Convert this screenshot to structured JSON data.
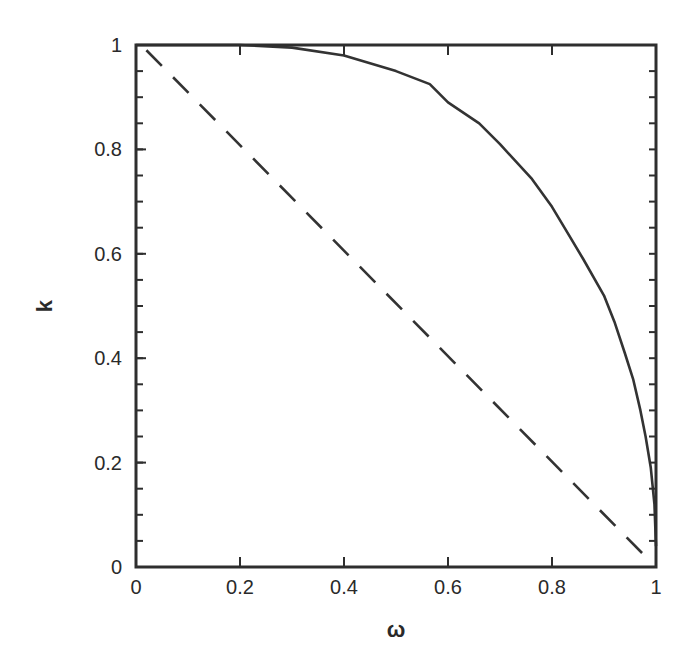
{
  "chart_data": {
    "type": "line",
    "title": "",
    "xlabel": "ω",
    "ylabel": "k",
    "xlim": [
      0,
      1
    ],
    "ylim": [
      0,
      1
    ],
    "grid": false,
    "legend": "none",
    "x_ticks": [
      0,
      0.2,
      0.4,
      0.6,
      0.8,
      1
    ],
    "x_tick_labels": [
      "0",
      "0.2",
      "0.4",
      "0.6",
      "0.8",
      "1"
    ],
    "y_ticks": [
      0,
      0.2,
      0.4,
      0.6,
      0.8,
      1
    ],
    "y_tick_labels": [
      "0",
      "0.2",
      "0.4",
      "0.6",
      "0.8",
      "1"
    ],
    "y_minor_step": 0.05,
    "series": [
      {
        "name": "solid-curve",
        "style": "solid",
        "color": "#333333",
        "x": [
          0.0,
          0.1,
          0.2,
          0.3,
          0.4,
          0.5,
          0.565,
          0.6,
          0.66,
          0.7,
          0.76,
          0.8,
          0.83,
          0.86,
          0.9,
          0.92,
          0.94,
          0.956,
          0.97,
          0.98,
          0.99,
          0.997,
          1.0
        ],
        "y": [
          1.0,
          1.0,
          1.0,
          0.995,
          0.98,
          0.95,
          0.925,
          0.89,
          0.85,
          0.81,
          0.745,
          0.69,
          0.64,
          0.59,
          0.52,
          0.47,
          0.41,
          0.36,
          0.3,
          0.25,
          0.19,
          0.12,
          0.04
        ]
      },
      {
        "name": "dashed-line",
        "style": "dashed",
        "color": "#333333",
        "x": [
          0.02,
          0.98
        ],
        "y": [
          0.99,
          0.02
        ]
      }
    ]
  }
}
